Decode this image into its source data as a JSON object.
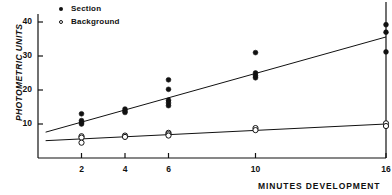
{
  "chart_data": {
    "type": "scatter",
    "title": "",
    "xlabel": "MINUTES DEVELOPMENT",
    "ylabel": "PHOTOMETRIC UNITS",
    "xlim": [
      0,
      16
    ],
    "ylim": [
      0,
      43
    ],
    "grid": false,
    "legend_position": "top-left",
    "xticks": [
      2,
      4,
      6,
      10,
      16
    ],
    "xtick_labels": [
      "2",
      "4",
      "6",
      "10",
      "16"
    ],
    "yticks": [
      10,
      20,
      30,
      40
    ],
    "ytick_labels": [
      "10",
      "20",
      "30",
      "40"
    ],
    "series": [
      {
        "name": "Section",
        "marker": "filled-circle",
        "color": "#111111",
        "points": [
          {
            "x": 2,
            "y": 13.0
          },
          {
            "x": 2,
            "y": 11.0
          },
          {
            "x": 2,
            "y": 10.4
          },
          {
            "x": 2,
            "y": 10.0
          },
          {
            "x": 4,
            "y": 14.4
          },
          {
            "x": 4,
            "y": 13.8
          },
          {
            "x": 4,
            "y": 13.4
          },
          {
            "x": 6,
            "y": 23.0
          },
          {
            "x": 6,
            "y": 20.2
          },
          {
            "x": 6,
            "y": 17.0
          },
          {
            "x": 6,
            "y": 16.2
          },
          {
            "x": 6,
            "y": 15.4
          },
          {
            "x": 10,
            "y": 31.0
          },
          {
            "x": 10,
            "y": 25.0
          },
          {
            "x": 10,
            "y": 24.2
          },
          {
            "x": 10,
            "y": 23.6
          },
          {
            "x": 16,
            "y": 39.2
          },
          {
            "x": 16,
            "y": 37.0
          },
          {
            "x": 16,
            "y": 31.2
          }
        ]
      },
      {
        "name": "Background",
        "marker": "open-circle",
        "color": "#111111",
        "points": [
          {
            "x": 2,
            "y": 6.4
          },
          {
            "x": 2,
            "y": 6.0
          },
          {
            "x": 2,
            "y": 4.5
          },
          {
            "x": 4,
            "y": 6.6
          },
          {
            "x": 4,
            "y": 6.2
          },
          {
            "x": 6,
            "y": 7.4
          },
          {
            "x": 6,
            "y": 7.0
          },
          {
            "x": 6,
            "y": 6.6
          },
          {
            "x": 10,
            "y": 8.8
          },
          {
            "x": 10,
            "y": 8.2
          },
          {
            "x": 16,
            "y": 10.2
          },
          {
            "x": 16,
            "y": 9.4
          }
        ]
      }
    ],
    "fit_lines": [
      {
        "name": "Section regression line",
        "for_series": "Section",
        "x_start": 0.35,
        "y_start": 7.6,
        "x_end": 16.0,
        "y_end": 35.6
      },
      {
        "name": "Background regression line",
        "for_series": "Background",
        "x_start": 0.35,
        "y_start": 5.1,
        "x_end": 16.0,
        "y_end": 10.0
      }
    ]
  },
  "legend": {
    "items": [
      {
        "label": "Section",
        "marker": "filled-circle"
      },
      {
        "label": "Background",
        "marker": "open-circle"
      }
    ]
  },
  "axes": {
    "y_title": "PHOTOMETRIC UNITS",
    "x_title": "MINUTES DEVELOPMENT"
  }
}
